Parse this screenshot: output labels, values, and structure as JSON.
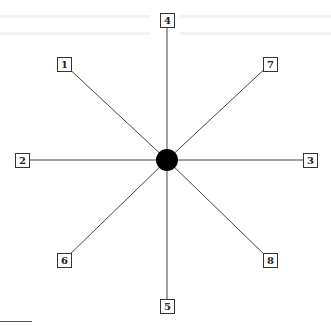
{
  "diagram": {
    "type": "radial-star",
    "center": {
      "x": 167,
      "y": 160,
      "radius": 11,
      "color": "#000000"
    },
    "line_color": "#444444",
    "nodes": [
      {
        "label": "1",
        "x": 64,
        "y": 64
      },
      {
        "label": "2",
        "x": 22,
        "y": 160
      },
      {
        "label": "3",
        "x": 310,
        "y": 160
      },
      {
        "label": "4",
        "x": 167,
        "y": 20
      },
      {
        "label": "5",
        "x": 167,
        "y": 306
      },
      {
        "label": "6",
        "x": 64,
        "y": 260
      },
      {
        "label": "7",
        "x": 270,
        "y": 64
      },
      {
        "label": "8",
        "x": 270,
        "y": 260
      }
    ]
  }
}
